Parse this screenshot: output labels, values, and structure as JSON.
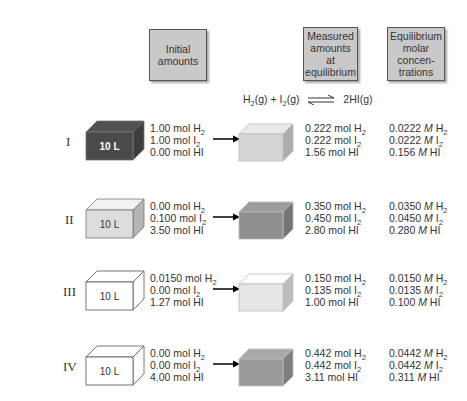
{
  "headers": {
    "initial": "Initial\namounts",
    "measured": "Measured\namounts\nat\nequilibrium",
    "equilibrium": "Equilibrium\nmolar\nconcen-\ntrations"
  },
  "reaction": {
    "reactant1": "H",
    "reactant1_sub": "2",
    "reactant1_state": "(g)",
    "plus": " + ",
    "reactant2": "I",
    "reactant2_sub": "2",
    "reactant2_state": "(g)",
    "arrow": "⇌",
    "product": "2HI",
    "product_state": "(g)"
  },
  "experiments": [
    {
      "label": "I",
      "volume": "10 L",
      "initial_box_color": "#4a4a4a",
      "initial_label_color": "#ffffff",
      "eq_box_color": "#d4d4d4",
      "initial": [
        [
          "1.00 mol H",
          "2"
        ],
        [
          "1.00 mol I",
          "2"
        ],
        [
          "0.00 mol HI",
          ""
        ]
      ],
      "measured": [
        [
          "0.222 mol H",
          "2"
        ],
        [
          "0.222 mol I",
          "2"
        ],
        [
          "1.56 mol HI",
          ""
        ]
      ],
      "conc": [
        [
          "0.0222 ",
          "M",
          " H",
          "2"
        ],
        [
          "0.0222 ",
          "M",
          " I",
          "2"
        ],
        [
          "0.156 ",
          "M",
          " HI",
          ""
        ]
      ]
    },
    {
      "label": "II",
      "volume": "10 L",
      "initial_box_color": "#dcdcdc",
      "initial_label_color": "#333333",
      "eq_box_color": "#8f8f8f",
      "initial": [
        [
          "0.00 mol H",
          "2"
        ],
        [
          "0.100 mol I",
          "2"
        ],
        [
          "3.50 mol HI",
          ""
        ]
      ],
      "measured": [
        [
          "0.350 mol H",
          "2"
        ],
        [
          "0.450 mol I",
          "2"
        ],
        [
          "2.80 mol HI",
          ""
        ]
      ],
      "conc": [
        [
          "0.0350 ",
          "M",
          " H",
          "2"
        ],
        [
          "0.0450 ",
          "M",
          " I",
          "2"
        ],
        [
          "0.280 ",
          "M",
          " HI",
          ""
        ]
      ]
    },
    {
      "label": "III",
      "volume": "10 L",
      "initial_box_color": "#ffffff",
      "initial_label_color": "#333333",
      "eq_box_color": "#e6e6e6",
      "initial": [
        [
          "0.0150 mol H",
          "2"
        ],
        [
          "0.00 mol I",
          "2"
        ],
        [
          "1.27 mol HI",
          ""
        ]
      ],
      "measured": [
        [
          "0.150 mol H",
          "2"
        ],
        [
          "0.135 mol I",
          "2"
        ],
        [
          "1.00 mol HI",
          ""
        ]
      ],
      "conc": [
        [
          "0.0150 ",
          "M",
          " H",
          "2"
        ],
        [
          "0.0135 ",
          "M",
          " I",
          "2"
        ],
        [
          "0.100 ",
          "M",
          " HI",
          ""
        ]
      ]
    },
    {
      "label": "IV",
      "volume": "10 L",
      "initial_box_color": "#ffffff",
      "initial_label_color": "#333333",
      "eq_box_color": "#9a9a9a",
      "initial": [
        [
          "0.00 mol H",
          "2"
        ],
        [
          "0.00 mol I",
          "2"
        ],
        [
          "4.00 mol HI",
          ""
        ]
      ],
      "measured": [
        [
          "0.442 mol H",
          "2"
        ],
        [
          "0.442 mol I",
          "2"
        ],
        [
          "3.11 mol HI",
          ""
        ]
      ],
      "conc": [
        [
          "0.0442 ",
          "M",
          " H",
          "2"
        ],
        [
          "0.0442 ",
          "M",
          " I",
          "2"
        ],
        [
          "0.311 ",
          "M",
          " HI",
          ""
        ]
      ]
    }
  ]
}
